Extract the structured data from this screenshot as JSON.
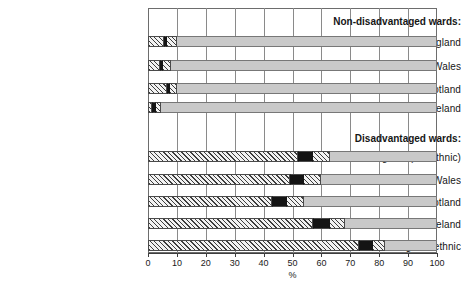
{
  "chart_data": {
    "type": "bar",
    "orientation": "horizontal",
    "stacked": true,
    "title": "",
    "xlabel": "%",
    "ylabel": "",
    "xlim": [
      0,
      100
    ],
    "xticks": [
      0,
      10,
      20,
      30,
      40,
      50,
      60,
      70,
      80,
      90,
      100
    ],
    "xticklabels": [
      "0",
      "10",
      "20",
      "30",
      "40",
      "50",
      "60",
      "70",
      "80",
      "90",
      "100"
    ],
    "grid": "vertical",
    "legend": "none",
    "groups": [
      {
        "name": "Non-disadvantaged wards:",
        "categories": [
          "England",
          "Wales",
          "Scotland",
          "Northern Ireland"
        ]
      },
      {
        "name": "Disadvantaged wards:",
        "categories": [
          "England (not ethnic)",
          "Wales",
          "Scotland",
          "Northern Ireland",
          "England ethnic"
        ]
      }
    ],
    "series": [
      {
        "name": "lower-hatched",
        "values": [
          5.5,
          4.0,
          6.5,
          1.5,
          52.0,
          49.0,
          43.0,
          57.0,
          73.0
        ]
      },
      {
        "name": "black-marker",
        "values": [
          1.2,
          1.2,
          1.2,
          1.2,
          5.0,
          5.0,
          5.0,
          6.0,
          5.0
        ]
      },
      {
        "name": "upper-hatched",
        "values": [
          3.3,
          2.8,
          2.3,
          1.8,
          6.0,
          6.0,
          6.0,
          5.0,
          4.0
        ]
      }
    ],
    "categories": [
      "England",
      "Wales",
      "Scotland",
      "Northern Ireland",
      "England (not ethnic)",
      "Wales",
      "Scotland",
      "Northern Ireland",
      "England ethnic"
    ],
    "bars": [
      {
        "label": "England",
        "group": "Non-disadvantaged wards:",
        "start": 0,
        "black_start": 5.5,
        "black_end": 6.7,
        "end": 10.0
      },
      {
        "label": "Wales",
        "group": "Non-disadvantaged wards:",
        "start": 0,
        "black_start": 4.0,
        "black_end": 5.2,
        "end": 8.0
      },
      {
        "label": "Scotland",
        "group": "Non-disadvantaged wards:",
        "start": 0,
        "black_start": 6.5,
        "black_end": 7.7,
        "end": 10.0
      },
      {
        "label": "Northern Ireland",
        "group": "Non-disadvantaged wards:",
        "start": 0,
        "black_start": 1.5,
        "black_end": 2.7,
        "end": 4.5
      },
      {
        "label": "England (not ethnic)",
        "group": "Disadvantaged wards:",
        "start": 0,
        "black_start": 52.0,
        "black_end": 57.0,
        "end": 63.0
      },
      {
        "label": "Wales",
        "group": "Disadvantaged wards:",
        "start": 0,
        "black_start": 49.0,
        "black_end": 54.0,
        "end": 60.0
      },
      {
        "label": "Scotland",
        "group": "Disadvantaged wards:",
        "start": 0,
        "black_start": 43.0,
        "black_end": 48.0,
        "end": 54.0
      },
      {
        "label": "Northern Ireland",
        "group": "Disadvantaged wards:",
        "start": 0,
        "black_start": 57.0,
        "black_end": 63.0,
        "end": 68.0
      },
      {
        "label": "England ethnic",
        "group": "Disadvantaged wards:",
        "start": 0,
        "black_start": 73.0,
        "black_end": 78.0,
        "end": 82.0
      }
    ]
  },
  "axis": {
    "x_title": "%",
    "tick_labels": [
      "0",
      "10",
      "20",
      "30",
      "40",
      "50",
      "60",
      "70",
      "80",
      "90",
      "100"
    ]
  },
  "labels": {
    "group_non_disadvantaged": "Non-disadvantaged wards:",
    "group_disadvantaged": "Disadvantaged wards:",
    "row_england": "England",
    "row_wales": "Wales",
    "row_scotland": "Scotland",
    "row_northern_ireland": "Northern Ireland",
    "row_england_not_ethnic": "England (not ethnic)",
    "row_wales_2": "Wales",
    "row_scotland_2": "Scotland",
    "row_northern_ireland_2": "Northern Ireland",
    "row_england_ethnic": "England ethnic"
  },
  "colors": {
    "bar_remainder": "#c9c9c9",
    "hatch_line": "#3d3d3d",
    "hatch_bg": "#f2f2f2",
    "marker_black": "#141414",
    "gridline": "#8a8a8a",
    "frame": "#6d6d6d",
    "text": "#161616"
  }
}
